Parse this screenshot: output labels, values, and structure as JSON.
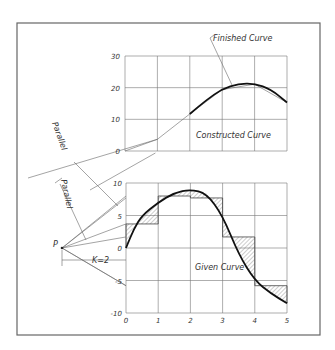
{
  "labels": {
    "finished_curve": "Finished Curve",
    "constructed_curve": "Constructed Curve",
    "given_curve": "Given Curve",
    "parallel_1": "Parallel",
    "parallel_2": "Parallel",
    "pole": "P",
    "pole_distance": "K=2"
  },
  "chart_data": [
    {
      "type": "line",
      "name": "integral-curve",
      "x_ticks": [
        "0",
        "1",
        "2",
        "3",
        "4",
        "5"
      ],
      "y_ticks": [
        "0",
        "10",
        "20",
        "30"
      ],
      "ylim": [
        0,
        30
      ],
      "xlim": [
        0,
        5
      ],
      "grid": true,
      "series": [
        {
          "name": "Constructed Curve",
          "x": [
            0,
            1,
            2,
            3,
            4,
            5
          ],
          "y": [
            0,
            3.7,
            11.7,
            19.4,
            21.1,
            15.3
          ]
        },
        {
          "name": "Finished Curve",
          "x": [
            2,
            2.5,
            3,
            3.5,
            4,
            4.5,
            5
          ],
          "y": [
            11.7,
            16,
            19.6,
            21.2,
            21.3,
            19.5,
            15.3
          ]
        }
      ]
    },
    {
      "type": "line",
      "name": "given-curve",
      "x_ticks": [
        "0",
        "1",
        "2",
        "3",
        "4",
        "5"
      ],
      "y_ticks": [
        "10",
        "5",
        "0",
        "-5",
        "-10"
      ],
      "ylim": [
        -10,
        10
      ],
      "xlim": [
        0,
        5
      ],
      "grid": true,
      "series": [
        {
          "name": "Given Curve",
          "x": [
            0,
            0.25,
            0.5,
            1,
            1.5,
            2,
            2.5,
            3,
            3.5,
            4,
            4.5,
            5
          ],
          "y": [
            0,
            3,
            5,
            7,
            8.5,
            9,
            8.4,
            5,
            -1,
            -5,
            -7,
            -8.5
          ]
        },
        {
          "name": "Mean Ordinates",
          "x": [
            0,
            1,
            2,
            3,
            4
          ],
          "y": [
            3.7,
            8,
            7.7,
            1.7,
            -5.8
          ]
        }
      ]
    }
  ]
}
